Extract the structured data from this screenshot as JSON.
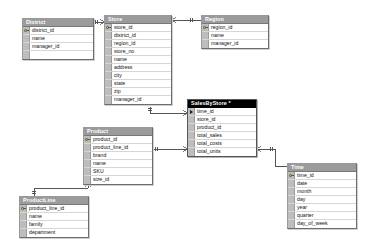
{
  "diagram": {
    "kind": "database-relationship-diagram",
    "background": "#ffffff",
    "header_color": "#9b9b9b",
    "selected_header_color": "#000000",
    "gutter_color": "#bdbdbd",
    "line_color": "#555555"
  },
  "tables": [
    {
      "id": "district",
      "name": "District",
      "selected": false,
      "x": 22,
      "y": 18,
      "w": 72,
      "fields": [
        {
          "label": "district_id",
          "pk": true
        },
        {
          "label": "name",
          "pk": false
        },
        {
          "label": "manager_id",
          "pk": false
        },
        {
          "label": "",
          "pk": false,
          "empty": true
        }
      ]
    },
    {
      "id": "store",
      "name": "Store",
      "selected": false,
      "x": 104,
      "y": 15,
      "w": 68,
      "fields": [
        {
          "label": "store_id",
          "pk": true
        },
        {
          "label": "district_id",
          "pk": false
        },
        {
          "label": "region_id",
          "pk": false
        },
        {
          "label": "store_no",
          "pk": false
        },
        {
          "label": "name",
          "pk": false
        },
        {
          "label": "address",
          "pk": false
        },
        {
          "label": "city",
          "pk": false
        },
        {
          "label": "state",
          "pk": false
        },
        {
          "label": "zip",
          "pk": false
        },
        {
          "label": "manager_id",
          "pk": false
        }
      ]
    },
    {
      "id": "region",
      "name": "Region",
      "selected": false,
      "x": 201,
      "y": 15,
      "w": 68,
      "fields": [
        {
          "label": "region_id",
          "pk": true
        },
        {
          "label": "name",
          "pk": false
        },
        {
          "label": "manager_id",
          "pk": false
        }
      ]
    },
    {
      "id": "salesbystore",
      "name": "SalesByStore *",
      "selected": true,
      "x": 187,
      "y": 99,
      "w": 70,
      "fields": [
        {
          "label": "time_id",
          "pk": false,
          "marker": true
        },
        {
          "label": "store_id",
          "pk": false
        },
        {
          "label": "product_id",
          "pk": false
        },
        {
          "label": "total_sales",
          "pk": false
        },
        {
          "label": "total_costs",
          "pk": false
        },
        {
          "label": "total_units",
          "pk": false
        }
      ]
    },
    {
      "id": "product",
      "name": "Product",
      "selected": false,
      "x": 83,
      "y": 127,
      "w": 70,
      "fields": [
        {
          "label": "product_id",
          "pk": true
        },
        {
          "label": "product_line_id",
          "pk": false
        },
        {
          "label": "brand",
          "pk": false
        },
        {
          "label": "name",
          "pk": false
        },
        {
          "label": "SKU",
          "pk": false
        },
        {
          "label": "size_id",
          "pk": false
        }
      ]
    },
    {
      "id": "productline",
      "name": "ProductLine",
      "selected": false,
      "x": 19,
      "y": 196,
      "w": 70,
      "fields": [
        {
          "label": "product_line_id",
          "pk": true
        },
        {
          "label": "name",
          "pk": false
        },
        {
          "label": "family",
          "pk": false
        },
        {
          "label": "department",
          "pk": false
        }
      ]
    },
    {
      "id": "time",
      "name": "Time",
      "selected": false,
      "x": 287,
      "y": 163,
      "w": 70,
      "fields": [
        {
          "label": "time_id",
          "pk": true
        },
        {
          "label": "date",
          "pk": false
        },
        {
          "label": "month",
          "pk": false
        },
        {
          "label": "day",
          "pk": false
        },
        {
          "label": "year",
          "pk": false
        },
        {
          "label": "quarter",
          "pk": false
        },
        {
          "label": "day_of_week",
          "pk": false
        }
      ]
    }
  ],
  "relationships": [
    {
      "id": "district-store",
      "from": "District",
      "to": "Store",
      "from_card": "one",
      "to_card": "many"
    },
    {
      "id": "store-region",
      "from": "Store",
      "to": "Region",
      "from_card": "many",
      "to_card": "one"
    },
    {
      "id": "store-sales",
      "from": "Store",
      "to": "SalesByStore",
      "from_card": "one",
      "to_card": "many"
    },
    {
      "id": "product-sales",
      "from": "Product",
      "to": "SalesByStore",
      "from_card": "one",
      "to_card": "many"
    },
    {
      "id": "sales-time",
      "from": "SalesByStore",
      "to": "Time",
      "from_card": "many",
      "to_card": "one"
    },
    {
      "id": "productline-product",
      "from": "ProductLine",
      "to": "Product",
      "from_card": "one",
      "to_card": "many"
    }
  ]
}
